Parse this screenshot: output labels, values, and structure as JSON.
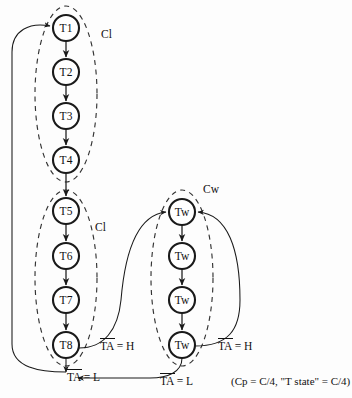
{
  "diagram": {
    "canvas": {
      "width": 352,
      "height": 398
    },
    "colors": {
      "background": "#fdfdfd",
      "node_stroke": "#1a1a1a",
      "node_fill": "#ffffff",
      "edge": "#1a1a1a",
      "cluster_stroke": "#333333",
      "text": "#111111"
    },
    "nodes": [
      {
        "id": "T1",
        "label": "T1",
        "cx": 66,
        "cy": 28,
        "r": 13
      },
      {
        "id": "T2",
        "label": "T2",
        "cx": 66,
        "cy": 72,
        "r": 13
      },
      {
        "id": "T3",
        "label": "T3",
        "cx": 66,
        "cy": 116,
        "r": 13
      },
      {
        "id": "T4",
        "label": "T4",
        "cx": 66,
        "cy": 160,
        "r": 13
      },
      {
        "id": "T5",
        "label": "T5",
        "cx": 66,
        "cy": 211,
        "r": 13
      },
      {
        "id": "T6",
        "label": "T6",
        "cx": 66,
        "cy": 256,
        "r": 13
      },
      {
        "id": "T7",
        "label": "T7",
        "cx": 66,
        "cy": 300,
        "r": 13
      },
      {
        "id": "T8",
        "label": "T8",
        "cx": 66,
        "cy": 345,
        "r": 13
      },
      {
        "id": "Tw1",
        "label": "Tw",
        "cx": 182,
        "cy": 212,
        "r": 13
      },
      {
        "id": "Tw2",
        "label": "Tw",
        "cx": 182,
        "cy": 256,
        "r": 13
      },
      {
        "id": "Tw3",
        "label": "Tw",
        "cx": 182,
        "cy": 300,
        "r": 13
      },
      {
        "id": "Tw4",
        "label": "Tw",
        "cx": 182,
        "cy": 345,
        "r": 13
      }
    ],
    "clusters": [
      {
        "id": "cluster-cl-top",
        "label": "Cl",
        "cx": 66,
        "cy": 94,
        "rx": 31,
        "ry": 88,
        "label_x": 101,
        "label_y": 38
      },
      {
        "id": "cluster-cl-bottom",
        "label": "Cl",
        "cx": 66,
        "cy": 278,
        "rx": 31,
        "ry": 88,
        "label_x": 95,
        "label_y": 231
      },
      {
        "id": "cluster-cw",
        "label": "Cw",
        "cx": 182,
        "cy": 278,
        "rx": 31,
        "ry": 88,
        "label_x": 203,
        "label_y": 193
      }
    ],
    "labels": [
      {
        "id": "ta-high-left",
        "text": "TA = H",
        "overline_text": "TA",
        "x": 100,
        "y": 347
      },
      {
        "id": "ta-low-left",
        "text": "TA = L",
        "overline_text": "TA",
        "x": 67,
        "y": 378
      },
      {
        "id": "ta-high-right",
        "text": "TA = H",
        "overline_text": "TA",
        "x": 218,
        "y": 347
      },
      {
        "id": "ta-low-right",
        "text": "TA = L",
        "overline_text": "TA",
        "x": 160,
        "y": 382
      }
    ],
    "note": {
      "id": "timing-note",
      "text": "(Cp = C/4, \"T state\" = C/4)",
      "x": 231,
      "y": 382
    },
    "edges": [
      {
        "from": "T1",
        "to": "T2",
        "kind": "sequential"
      },
      {
        "from": "T2",
        "to": "T3",
        "kind": "sequential"
      },
      {
        "from": "T3",
        "to": "T4",
        "kind": "sequential"
      },
      {
        "from": "T4",
        "to": "T5",
        "kind": "sequential"
      },
      {
        "from": "T5",
        "to": "T6",
        "kind": "sequential"
      },
      {
        "from": "T6",
        "to": "T7",
        "kind": "sequential"
      },
      {
        "from": "T7",
        "to": "T8",
        "kind": "sequential"
      },
      {
        "from": "Tw1",
        "to": "Tw2",
        "kind": "sequential"
      },
      {
        "from": "Tw2",
        "to": "Tw3",
        "kind": "sequential"
      },
      {
        "from": "Tw3",
        "to": "Tw4",
        "kind": "sequential"
      },
      {
        "from": "T8",
        "to": "Tw1",
        "kind": "conditional",
        "condition": "TA = H"
      },
      {
        "from": "T8",
        "to": "T1",
        "kind": "conditional",
        "condition": "TA = L"
      },
      {
        "from": "Tw4",
        "to": "Tw1",
        "kind": "conditional",
        "condition": "TA = H"
      },
      {
        "from": "Tw4",
        "to": "T1",
        "kind": "conditional",
        "condition": "TA = L"
      }
    ]
  }
}
